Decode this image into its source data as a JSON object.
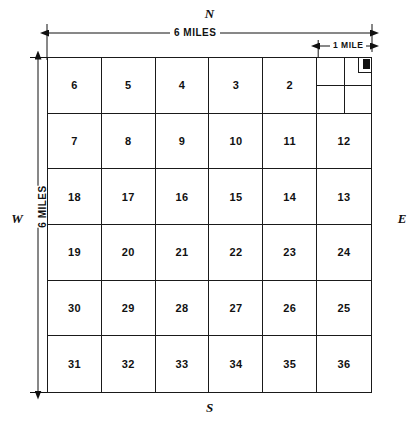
{
  "figure": {
    "compass": {
      "north": "N",
      "south": "S",
      "east": "E",
      "west": "W"
    },
    "dimensions": {
      "top_span_label": "6 MILES",
      "left_span_label": "6 MILES",
      "section_span_label": "1 MILE"
    },
    "grid": {
      "columns": 6,
      "rows": 6,
      "rows_data": [
        [
          "6",
          "5",
          "4",
          "3",
          "2",
          ""
        ],
        [
          "7",
          "8",
          "9",
          "10",
          "11",
          "12"
        ],
        [
          "18",
          "17",
          "16",
          "15",
          "14",
          "13"
        ],
        [
          "19",
          "20",
          "21",
          "22",
          "23",
          "24"
        ],
        [
          "30",
          "29",
          "28",
          "27",
          "26",
          "25"
        ],
        [
          "31",
          "32",
          "33",
          "34",
          "35",
          "36"
        ]
      ],
      "subdivided_cell": {
        "row": 0,
        "col": 5,
        "note": "quarter sections with quarter-quarter corner marker"
      }
    },
    "colors": {
      "ink": "#111111",
      "paper": "#ffffff"
    }
  }
}
